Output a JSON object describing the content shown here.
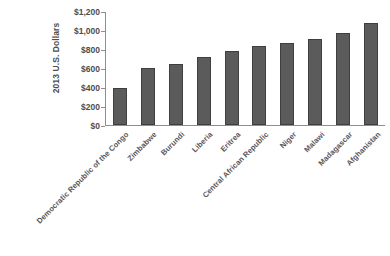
{
  "chart_data": {
    "type": "bar",
    "title": "",
    "subtitle": "",
    "xlabel": "",
    "ylabel": "2013 U.S. Dollars",
    "ylim": [
      0,
      1200
    ],
    "y_ticks": [
      0,
      200,
      400,
      600,
      800,
      1000,
      1200
    ],
    "y_ticklabels": [
      "$0",
      "$200",
      "$400",
      "$600",
      "$800",
      "$1,000",
      "$1,200"
    ],
    "grid": false,
    "legend": null,
    "bar_color": "#5b5b5b",
    "categories": [
      "Democratic Republic of the Congo",
      "Zimbabwe",
      "Burundi",
      "Liberia",
      "Eritrea",
      "Central African Republic",
      "Niger",
      "Malawi",
      "Madagascar",
      "Afghanistan"
    ],
    "values": [
      394,
      600,
      645,
      715,
      780,
      835,
      860,
      905,
      970,
      1075
    ]
  },
  "axis": {
    "y_title": "2013 U.S. Dollars"
  }
}
